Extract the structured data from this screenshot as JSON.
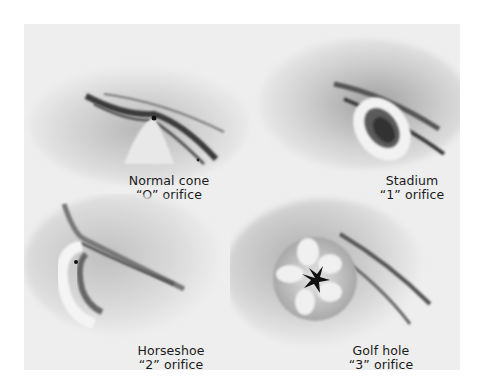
{
  "figure": {
    "background": "#ffffff",
    "plate_color": "#eeeeee",
    "panels": [
      {
        "id": "normal-cone",
        "title": "Normal cone",
        "subtitle": "“O” orifice",
        "shape": "cone-with-pinhole"
      },
      {
        "id": "stadium",
        "title": "Stadium",
        "subtitle": "“1” orifice",
        "shape": "oval-ring"
      },
      {
        "id": "horseshoe",
        "title": "Horseshoe",
        "subtitle": "“2” orifice",
        "shape": "horseshoe-fold"
      },
      {
        "id": "golf-hole",
        "title": "Golf hole",
        "subtitle": "“3” orifice",
        "shape": "stellate-gaping-orifice"
      }
    ]
  }
}
